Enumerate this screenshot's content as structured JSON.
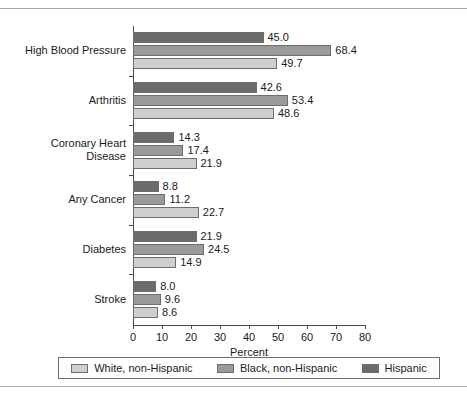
{
  "chart_data": {
    "type": "bar",
    "orientation": "horizontal",
    "title": "",
    "xlabel": "Percent",
    "ylabel": "",
    "xlim": [
      0,
      80
    ],
    "xticks": [
      0,
      10,
      20,
      30,
      40,
      50,
      60,
      70,
      80
    ],
    "grid": false,
    "legend_position": "bottom",
    "categories": [
      "High Blood Pressure",
      "Arthritis",
      "Coronary Heart\nDisease",
      "Any Cancer",
      "Diabetes",
      "Stroke"
    ],
    "series": [
      {
        "name": "Hispanic",
        "color": "#6b6b6b",
        "values": [
          45.0,
          42.6,
          14.3,
          8.8,
          21.9,
          8.0
        ],
        "labels": [
          "45.0",
          "42.6",
          "14.3",
          "8.8",
          "21.9",
          "8.0"
        ]
      },
      {
        "name": "Black, non-Hispanic",
        "color": "#9a9a9a",
        "values": [
          68.4,
          53.4,
          17.4,
          11.2,
          24.5,
          9.6
        ],
        "labels": [
          "68.4",
          "53.4",
          "17.4",
          "11.2",
          "24.5",
          "9.6"
        ]
      },
      {
        "name": "White, non-Hispanic",
        "color": "#cfcfcf",
        "values": [
          49.7,
          48.6,
          21.9,
          22.7,
          14.9,
          8.6
        ],
        "labels": [
          "49.7",
          "48.6",
          "21.9",
          "22.7",
          "14.9",
          "8.6"
        ]
      }
    ],
    "legend": [
      {
        "label": "White, non-Hispanic",
        "color": "#cfcfcf"
      },
      {
        "label": "Black, non-Hispanic",
        "color": "#9a9a9a"
      },
      {
        "label": "Hispanic",
        "color": "#6b6b6b"
      }
    ]
  }
}
